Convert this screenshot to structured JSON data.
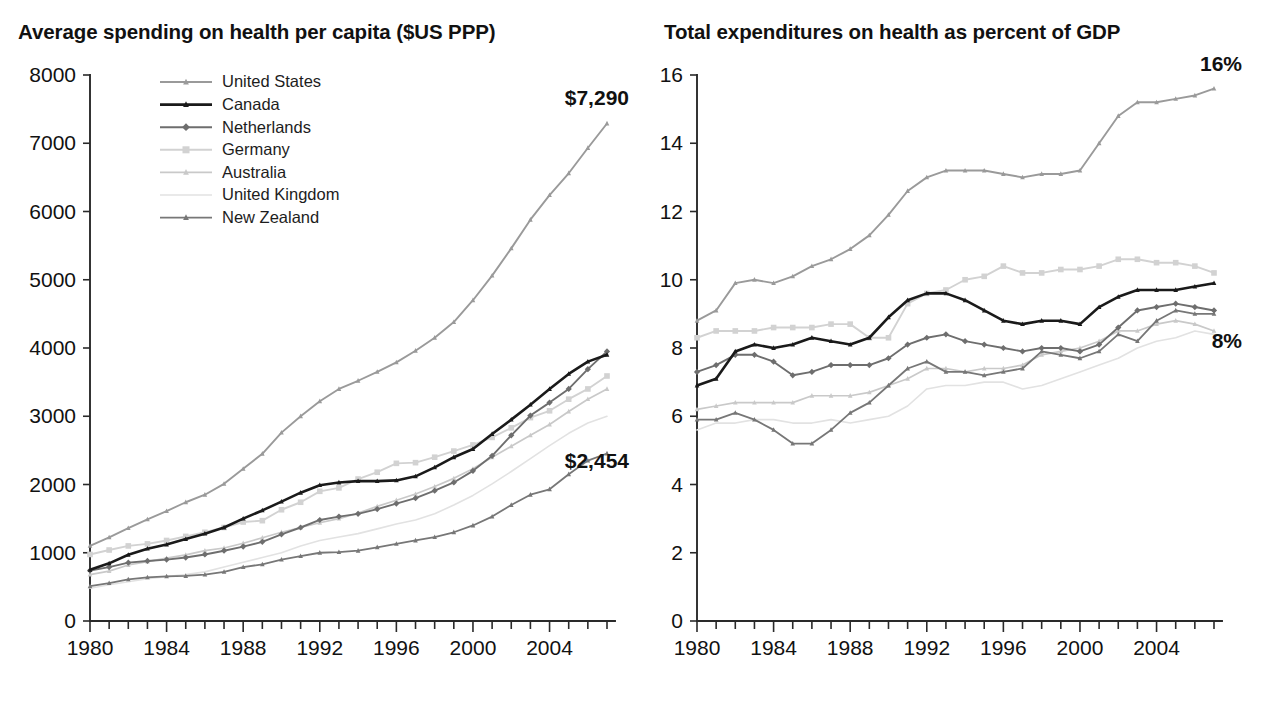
{
  "figure": {
    "panels": [
      {
        "id": "left",
        "title": "Average spending on health per capita ($US PPP)"
      },
      {
        "id": "right",
        "title": "Total expenditures on health as percent of GDP"
      }
    ]
  },
  "legend": {
    "position": "top-left-of-left-panel",
    "entries": [
      {
        "label": "United States",
        "color": "#9a9a9a",
        "marker": "triangle",
        "width": 1.9
      },
      {
        "label": "Canada",
        "color": "#1a1a1a",
        "marker": "triangle",
        "width": 2.6
      },
      {
        "label": "Netherlands",
        "color": "#6e6e6e",
        "marker": "diamond",
        "width": 1.9
      },
      {
        "label": "Germany",
        "color": "#d2d2d2",
        "marker": "square",
        "width": 1.9
      },
      {
        "label": "Australia",
        "color": "#c9c9c9",
        "marker": "triangle",
        "width": 1.7
      },
      {
        "label": "United Kingdom",
        "color": "#e2e2e2",
        "marker": "none",
        "width": 1.6
      },
      {
        "label": "New Zealand",
        "color": "#777777",
        "marker": "triangle",
        "width": 1.8
      }
    ]
  },
  "chart_data": [
    {
      "id": "spending-per-capita",
      "type": "line",
      "title": "Average spending on health per capita ($US PPP)",
      "xlabel": "",
      "ylabel": "",
      "xlim": [
        1980,
        2007
      ],
      "ylim": [
        0,
        8000
      ],
      "ytick_step": 1000,
      "xtick_step": 1,
      "xtick_label_step": 4,
      "grid": false,
      "yticks": [
        0,
        1000,
        2000,
        3000,
        4000,
        5000,
        6000,
        7000,
        8000
      ],
      "ytick_labels": [
        "0",
        "1000",
        "2000",
        "3000",
        "4000",
        "5000",
        "6000",
        "7000",
        "8000"
      ],
      "x": [
        1980,
        1981,
        1982,
        1983,
        1984,
        1985,
        1986,
        1987,
        1988,
        1989,
        1990,
        1991,
        1992,
        1993,
        1994,
        1995,
        1996,
        1997,
        1998,
        1999,
        2000,
        2001,
        2002,
        2003,
        2004,
        2005,
        2006,
        2007
      ],
      "xtick_labels": [
        "1980",
        "1984",
        "1988",
        "1992",
        "1996",
        "2000",
        "2004"
      ],
      "series": [
        {
          "name": "United States",
          "values": [
            1100,
            1225,
            1360,
            1490,
            1610,
            1740,
            1850,
            2010,
            2230,
            2450,
            2760,
            3000,
            3220,
            3400,
            3520,
            3650,
            3790,
            3960,
            4150,
            4380,
            4700,
            5060,
            5460,
            5880,
            6240,
            6560,
            6930,
            7290
          ]
        },
        {
          "name": "Canada",
          "values": [
            750,
            845,
            970,
            1060,
            1120,
            1200,
            1280,
            1370,
            1500,
            1620,
            1750,
            1880,
            1990,
            2030,
            2050,
            2050,
            2060,
            2120,
            2250,
            2400,
            2520,
            2740,
            2950,
            3170,
            3400,
            3620,
            3800,
            3900
          ]
        },
        {
          "name": "Netherlands",
          "values": [
            740,
            790,
            855,
            880,
            900,
            930,
            975,
            1030,
            1090,
            1160,
            1270,
            1370,
            1480,
            1530,
            1570,
            1640,
            1720,
            1800,
            1910,
            2030,
            2200,
            2420,
            2720,
            3010,
            3200,
            3400,
            3690,
            3950
          ]
        },
        {
          "name": "Germany",
          "values": [
            975,
            1040,
            1100,
            1130,
            1180,
            1240,
            1300,
            1370,
            1450,
            1470,
            1630,
            1740,
            1900,
            1950,
            2080,
            2180,
            2310,
            2320,
            2400,
            2490,
            2580,
            2690,
            2830,
            2980,
            3080,
            3250,
            3400,
            3590
          ]
        },
        {
          "name": "Australia",
          "values": [
            680,
            730,
            820,
            870,
            920,
            970,
            1030,
            1070,
            1140,
            1220,
            1300,
            1370,
            1440,
            1500,
            1580,
            1680,
            1770,
            1860,
            1970,
            2090,
            2230,
            2400,
            2560,
            2720,
            2880,
            3070,
            3250,
            3400
          ]
        },
        {
          "name": "United Kingdom",
          "values": [
            480,
            530,
            575,
            620,
            650,
            680,
            720,
            790,
            860,
            930,
            1000,
            1100,
            1180,
            1230,
            1280,
            1350,
            1420,
            1480,
            1570,
            1700,
            1840,
            2010,
            2190,
            2380,
            2570,
            2750,
            2900,
            3000
          ]
        },
        {
          "name": "New Zealand",
          "values": [
            510,
            555,
            610,
            640,
            655,
            660,
            680,
            720,
            790,
            830,
            900,
            950,
            1000,
            1010,
            1030,
            1080,
            1130,
            1180,
            1230,
            1300,
            1400,
            1530,
            1700,
            1850,
            1930,
            2150,
            2350,
            2454
          ]
        }
      ],
      "annotations": [
        {
          "text": "$7,290",
          "series": "United States",
          "year": 2007
        },
        {
          "text": "$2,454",
          "series": "New Zealand",
          "year": 2007
        }
      ]
    },
    {
      "id": "health-percent-gdp",
      "type": "line",
      "title": "Total expenditures on health as percent of GDP",
      "xlabel": "",
      "ylabel": "",
      "xlim": [
        1980,
        2007
      ],
      "ylim": [
        0,
        16
      ],
      "ytick_step": 2,
      "xtick_step": 1,
      "xtick_label_step": 4,
      "grid": false,
      "yticks": [
        0,
        2,
        4,
        6,
        8,
        10,
        12,
        14,
        16
      ],
      "ytick_labels": [
        "0",
        "2",
        "4",
        "6",
        "8",
        "10",
        "12",
        "14",
        "16"
      ],
      "x": [
        1980,
        1981,
        1982,
        1983,
        1984,
        1985,
        1986,
        1987,
        1988,
        1989,
        1990,
        1991,
        1992,
        1993,
        1994,
        1995,
        1996,
        1997,
        1998,
        1999,
        2000,
        2001,
        2002,
        2003,
        2004,
        2005,
        2006,
        2007
      ],
      "xtick_labels": [
        "1980",
        "1984",
        "1988",
        "1992",
        "1996",
        "2000",
        "2004"
      ],
      "series": [
        {
          "name": "United States",
          "values": [
            8.8,
            9.1,
            9.9,
            10.0,
            9.9,
            10.1,
            10.4,
            10.6,
            10.9,
            11.3,
            11.9,
            12.6,
            13.0,
            13.2,
            13.2,
            13.2,
            13.1,
            13.0,
            13.1,
            13.1,
            13.2,
            14.0,
            14.8,
            15.2,
            15.2,
            15.3,
            15.4,
            15.6
          ]
        },
        {
          "name": "Canada",
          "values": [
            6.9,
            7.1,
            7.9,
            8.1,
            8.0,
            8.1,
            8.3,
            8.2,
            8.1,
            8.3,
            8.9,
            9.4,
            9.6,
            9.6,
            9.4,
            9.1,
            8.8,
            8.7,
            8.8,
            8.8,
            8.7,
            9.2,
            9.5,
            9.7,
            9.7,
            9.7,
            9.8,
            9.9
          ]
        },
        {
          "name": "Netherlands",
          "values": [
            7.3,
            7.5,
            7.8,
            7.8,
            7.6,
            7.2,
            7.3,
            7.5,
            7.5,
            7.5,
            7.7,
            8.1,
            8.3,
            8.4,
            8.2,
            8.1,
            8.0,
            7.9,
            8.0,
            8.0,
            7.9,
            8.1,
            8.6,
            9.1,
            9.2,
            9.3,
            9.2,
            9.1
          ]
        },
        {
          "name": "Germany",
          "values": [
            8.3,
            8.5,
            8.5,
            8.5,
            8.6,
            8.6,
            8.6,
            8.7,
            8.7,
            8.3,
            8.3,
            9.3,
            9.6,
            9.7,
            10.0,
            10.1,
            10.4,
            10.2,
            10.2,
            10.3,
            10.3,
            10.4,
            10.6,
            10.6,
            10.5,
            10.5,
            10.4,
            10.2
          ]
        },
        {
          "name": "Australia",
          "values": [
            6.2,
            6.3,
            6.4,
            6.4,
            6.4,
            6.4,
            6.6,
            6.6,
            6.6,
            6.7,
            6.9,
            7.1,
            7.4,
            7.4,
            7.3,
            7.4,
            7.4,
            7.5,
            7.8,
            7.9,
            8.0,
            8.2,
            8.5,
            8.5,
            8.7,
            8.8,
            8.7,
            8.5
          ]
        },
        {
          "name": "United Kingdom",
          "values": [
            5.6,
            5.8,
            5.8,
            5.9,
            5.9,
            5.8,
            5.8,
            5.9,
            5.8,
            5.9,
            6.0,
            6.3,
            6.8,
            6.9,
            6.9,
            7.0,
            7.0,
            6.8,
            6.9,
            7.1,
            7.3,
            7.5,
            7.7,
            8.0,
            8.2,
            8.3,
            8.5,
            8.4
          ]
        },
        {
          "name": "New Zealand",
          "values": [
            5.9,
            5.9,
            6.1,
            5.9,
            5.6,
            5.2,
            5.2,
            5.6,
            6.1,
            6.4,
            6.9,
            7.4,
            7.6,
            7.3,
            7.3,
            7.2,
            7.3,
            7.4,
            7.9,
            7.8,
            7.7,
            7.9,
            8.4,
            8.2,
            8.8,
            9.1,
            9.0,
            9.0
          ]
        }
      ],
      "annotations": [
        {
          "text": "16%",
          "series": "United States",
          "year": 2007
        },
        {
          "text": "8%",
          "series": "United Kingdom",
          "year": 2007
        }
      ]
    }
  ]
}
